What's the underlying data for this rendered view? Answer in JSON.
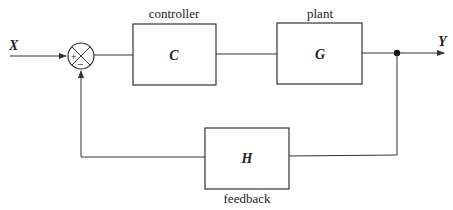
{
  "diagram": {
    "type": "feedback-control-loop",
    "input": {
      "label": "X"
    },
    "output": {
      "label": "Y"
    },
    "summing_junction": {
      "plus_sign": "+",
      "minus_sign": "–"
    },
    "blocks": {
      "controller": {
        "caption": "controller",
        "symbol": "C"
      },
      "plant": {
        "caption": "plant",
        "symbol": "G"
      },
      "feedback": {
        "caption": "feedback",
        "symbol": "H"
      }
    },
    "colors": {
      "stroke": "#333333",
      "background": "#ffffff"
    }
  }
}
